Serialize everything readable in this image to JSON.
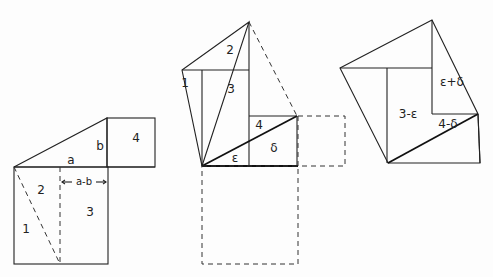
{
  "figure1": {
    "labels": {
      "a": "a",
      "b": "b",
      "four": "4",
      "two": "2",
      "one": "1",
      "three": "3",
      "a_minus_b": "a-b"
    }
  },
  "figure2": {
    "labels": {
      "two": "2",
      "one": "1",
      "three": "3",
      "four": "4",
      "epsilon": "ε",
      "delta": "δ"
    }
  },
  "figure3": {
    "labels": {
      "three_minus_epsilon": "3-ε",
      "epsilon_plus_delta": "ε+δ",
      "four_minus_delta": "4-δ"
    }
  },
  "colors": {
    "line": "#222222",
    "background": "#fdfdfd"
  }
}
